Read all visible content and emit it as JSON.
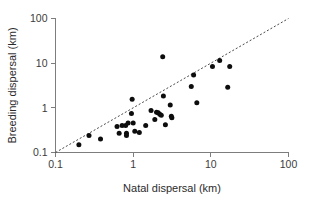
{
  "chart_data": {
    "type": "scatter",
    "title": "",
    "xlabel": "Natal dispersal (km)",
    "ylabel": "Breeding dispersal (km)",
    "xscale": "log",
    "yscale": "log",
    "xlim": [
      0.1,
      100
    ],
    "ylim": [
      0.1,
      100
    ],
    "grid": false,
    "legend": false,
    "xticks": [
      "0.1",
      "1",
      "10",
      "100"
    ],
    "xtick_values": [
      0.1,
      1,
      10,
      100
    ],
    "yticks": [
      "0.1",
      "1",
      "10",
      "100"
    ],
    "ytick_values": [
      0.1,
      1,
      10,
      100
    ],
    "marker": "filled-circle",
    "marker_color": "#0d0d0d",
    "reference_line": {
      "label": "1:1 line",
      "style": "dashed",
      "color": "#4a4a4a",
      "from": [
        0.1,
        0.1
      ],
      "to": [
        100,
        100
      ]
    },
    "points": [
      {
        "x": 0.2,
        "y": 0.15
      },
      {
        "x": 0.27,
        "y": 0.24
      },
      {
        "x": 0.38,
        "y": 0.2
      },
      {
        "x": 0.62,
        "y": 0.38
      },
      {
        "x": 0.66,
        "y": 0.27
      },
      {
        "x": 0.72,
        "y": 0.4
      },
      {
        "x": 0.8,
        "y": 0.4
      },
      {
        "x": 0.82,
        "y": 0.27
      },
      {
        "x": 0.82,
        "y": 0.24
      },
      {
        "x": 0.86,
        "y": 0.46
      },
      {
        "x": 0.95,
        "y": 0.75
      },
      {
        "x": 0.97,
        "y": 1.55
      },
      {
        "x": 1.0,
        "y": 0.46
      },
      {
        "x": 1.05,
        "y": 0.3
      },
      {
        "x": 1.2,
        "y": 0.28
      },
      {
        "x": 1.45,
        "y": 0.4
      },
      {
        "x": 1.7,
        "y": 0.87
      },
      {
        "x": 1.9,
        "y": 0.55
      },
      {
        "x": 2.0,
        "y": 0.8
      },
      {
        "x": 2.1,
        "y": 0.78
      },
      {
        "x": 2.2,
        "y": 0.72
      },
      {
        "x": 2.3,
        "y": 0.68
      },
      {
        "x": 2.4,
        "y": 14.0
      },
      {
        "x": 2.45,
        "y": 1.85
      },
      {
        "x": 2.6,
        "y": 0.42
      },
      {
        "x": 3.0,
        "y": 1.15
      },
      {
        "x": 3.1,
        "y": 0.65
      },
      {
        "x": 3.15,
        "y": 0.6
      },
      {
        "x": 5.6,
        "y": 3.0
      },
      {
        "x": 6.0,
        "y": 5.4
      },
      {
        "x": 6.6,
        "y": 1.3
      },
      {
        "x": 10.5,
        "y": 8.4
      },
      {
        "x": 13.0,
        "y": 11.5
      },
      {
        "x": 16.5,
        "y": 2.9
      },
      {
        "x": 17.5,
        "y": 8.4
      }
    ]
  }
}
